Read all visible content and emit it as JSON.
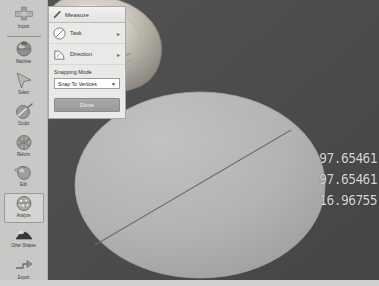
{
  "app": {
    "name": "3D Slicer Measure Tool",
    "accent_color": "#4a4a4a",
    "panel_bg": "#e9e9e7",
    "sidebar_bg": "#c8c8c6"
  },
  "sidebar": {
    "items": [
      {
        "label": "Import",
        "icon": "plus-import-icon",
        "selected": false,
        "two_line": false
      },
      {
        "label": "Machine",
        "icon": "sphere-machine-icon",
        "selected": false,
        "two_line": false
      },
      {
        "label": "Select",
        "icon": "cursor-arrow-icon",
        "selected": false,
        "two_line": false
      },
      {
        "label": "Sculpt",
        "icon": "sculpt-tool-icon",
        "selected": false,
        "two_line": false
      },
      {
        "label": "Reform",
        "icon": "reform-mesh-icon",
        "selected": false,
        "two_line": false
      },
      {
        "label": "Edit",
        "icon": "edit-sphere-icon",
        "selected": false,
        "two_line": false
      },
      {
        "label": "Analyze",
        "icon": "analyze-sphere-icon",
        "selected": true,
        "two_line": false
      },
      {
        "label": "Other Shapes",
        "icon": "other-shapes-icon",
        "selected": false,
        "two_line": true
      },
      {
        "label": "Export",
        "icon": "export-arrow-icon",
        "selected": false,
        "two_line": false
      }
    ]
  },
  "panel": {
    "title": "Measure",
    "title_icon": "pencil-icon",
    "rows": [
      {
        "label": "Task",
        "icon": "circle-slash-icon",
        "chevron": "▸"
      },
      {
        "label": "Direction",
        "icon": "angle-arc-icon",
        "chevron": "▸"
      }
    ],
    "snapping": {
      "label": "Snapping Mode",
      "value": "Snap To Vertices",
      "arrow": "▼",
      "options": [
        "Snap To Vertices",
        "Snap To Edges",
        "Snap To Faces",
        "No Snapping"
      ]
    },
    "done_label": "Done"
  },
  "viewport": {
    "model": "skull-3d-render",
    "overlay_shape": "measurement-circle",
    "background_color": "#4a4a4a",
    "circle_color": "#b4b4b4"
  },
  "readouts": {
    "values": [
      "97.65461",
      "97.65461",
      "16.96755"
    ]
  }
}
